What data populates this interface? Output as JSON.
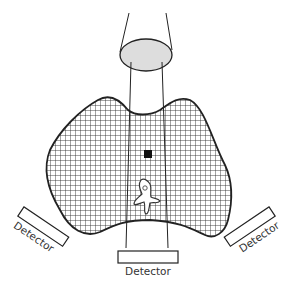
{
  "diagram": {
    "labels": {
      "detector_left": "Detector",
      "detector_bottom": "Detector",
      "detector_right": "Detector"
    },
    "colors": {
      "line": "#222222",
      "lens_fill": "#dddddd",
      "grid": "#333333",
      "target": "#111111",
      "background": "#ffffff"
    }
  }
}
